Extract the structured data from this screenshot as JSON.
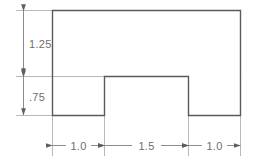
{
  "drawing": {
    "title": "Notched block profile with linear dimensions",
    "units_implied": "inches",
    "background_color": "#ffffff",
    "outline_color": "#5a5a5a",
    "dimension_line_color": "#8c8c8c",
    "extension_line_color": "#b8b8b8",
    "text_color": "#6e6e6e",
    "shape": {
      "name": "bridge-profile",
      "description": "Rectangle with a rectangular notch removed from the bottom center",
      "overall_width": "3.5",
      "overall_height": "2.0",
      "notch_width": "1.5",
      "notch_height": "0.75"
    },
    "vertical_dimensions": [
      {
        "id": "dim-upper-height",
        "label": "1.25",
        "orientation": "vertical",
        "position": "left",
        "spans_from": "top edge",
        "spans_to": "notch ceiling level"
      },
      {
        "id": "dim-lower-height",
        "label": ".75",
        "orientation": "vertical",
        "position": "left",
        "spans_from": "notch ceiling level",
        "spans_to": "bottom edge"
      }
    ],
    "horizontal_dimensions": [
      {
        "id": "dim-left-leg",
        "label": "1.0",
        "orientation": "horizontal",
        "position": "bottom",
        "segment": "left leg width"
      },
      {
        "id": "dim-notch-span",
        "label": "1.5",
        "orientation": "horizontal",
        "position": "bottom",
        "segment": "notch opening width"
      },
      {
        "id": "dim-right-leg",
        "label": "1.0",
        "orientation": "horizontal",
        "position": "bottom",
        "segment": "right leg width"
      }
    ]
  }
}
